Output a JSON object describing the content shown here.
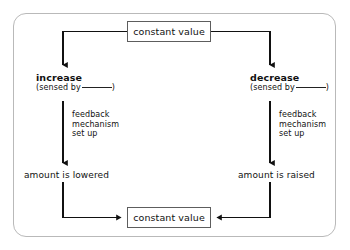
{
  "diagram": {
    "border_color": "#b9b9b9",
    "box_border_color": "#5d5d5d",
    "line_color": "#1a1a1a",
    "background": "#ffffff",
    "nodes": {
      "top_constant": "constant value",
      "bottom_constant": "constant value",
      "left_branch_head": "increase",
      "left_branch_sub_prefix": "(sensed by",
      "left_branch_sub_suffix": ")",
      "right_branch_head": "decrease",
      "right_branch_sub_prefix": "(sensed by",
      "right_branch_sub_suffix": ")",
      "left_feedback_line1": "feedback",
      "left_feedback_line2": "mechanism",
      "left_feedback_line3": "set up",
      "right_feedback_line1": "feedback",
      "right_feedback_line2": "mechanism",
      "right_feedback_line3": "set up",
      "left_outcome": "amount is lowered",
      "right_outcome": "amount is raised"
    },
    "connectors": [
      {
        "name": "top-to-left-branch",
        "from": "top_constant",
        "to": "left_branch_head",
        "arrow": "down"
      },
      {
        "name": "top-to-right-branch",
        "from": "top_constant",
        "to": "right_branch_head",
        "arrow": "down"
      },
      {
        "name": "left-branch-to-outcome",
        "from": "left_branch_head",
        "to": "left_outcome",
        "arrow": "down"
      },
      {
        "name": "right-branch-to-outcome",
        "from": "right_branch_head",
        "to": "right_outcome",
        "arrow": "down"
      },
      {
        "name": "left-outcome-to-bottom",
        "from": "left_outcome",
        "to": "bottom_constant",
        "arrow": "right"
      },
      {
        "name": "right-outcome-to-bottom",
        "from": "right_outcome",
        "to": "bottom_constant",
        "arrow": "left"
      }
    ]
  }
}
